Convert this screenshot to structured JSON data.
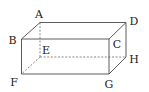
{
  "figure": {
    "type": "cuboid",
    "vertices": {
      "A": {
        "x": 40,
        "y": 22.5,
        "label_x": 39,
        "label_y": 14
      },
      "B": {
        "x": 21.5,
        "y": 39,
        "label_x": 12.5,
        "label_y": 40
      },
      "C": {
        "x": 109,
        "y": 39,
        "label_x": 117,
        "label_y": 44
      },
      "D": {
        "x": 126,
        "y": 22.5,
        "label_x": 134,
        "label_y": 21
      },
      "E": {
        "x": 40,
        "y": 57,
        "label_x": 46,
        "label_y": 50
      },
      "F": {
        "x": 21.5,
        "y": 74,
        "label_x": 14,
        "label_y": 82
      },
      "G": {
        "x": 109,
        "y": 74,
        "label_x": 109,
        "label_y": 83
      },
      "H": {
        "x": 126,
        "y": 57,
        "label_x": 134,
        "label_y": 59
      }
    },
    "labels": {
      "A": "A",
      "B": "B",
      "C": "C",
      "D": "D",
      "E": "E",
      "F": "F",
      "G": "G",
      "H": "H"
    },
    "visible_edges": [
      [
        "A",
        "D"
      ],
      [
        "A",
        "B"
      ],
      [
        "B",
        "C"
      ],
      [
        "C",
        "D"
      ],
      [
        "B",
        "F"
      ],
      [
        "F",
        "G"
      ],
      [
        "C",
        "G"
      ],
      [
        "G",
        "H"
      ],
      [
        "D",
        "H"
      ]
    ],
    "hidden_edges": [
      [
        "A",
        "E"
      ],
      [
        "E",
        "F"
      ],
      [
        "E",
        "H"
      ]
    ],
    "colors": {
      "edge": "#4a4a4a",
      "hidden_edge": "#6a6a6a",
      "label": "#222222"
    }
  }
}
